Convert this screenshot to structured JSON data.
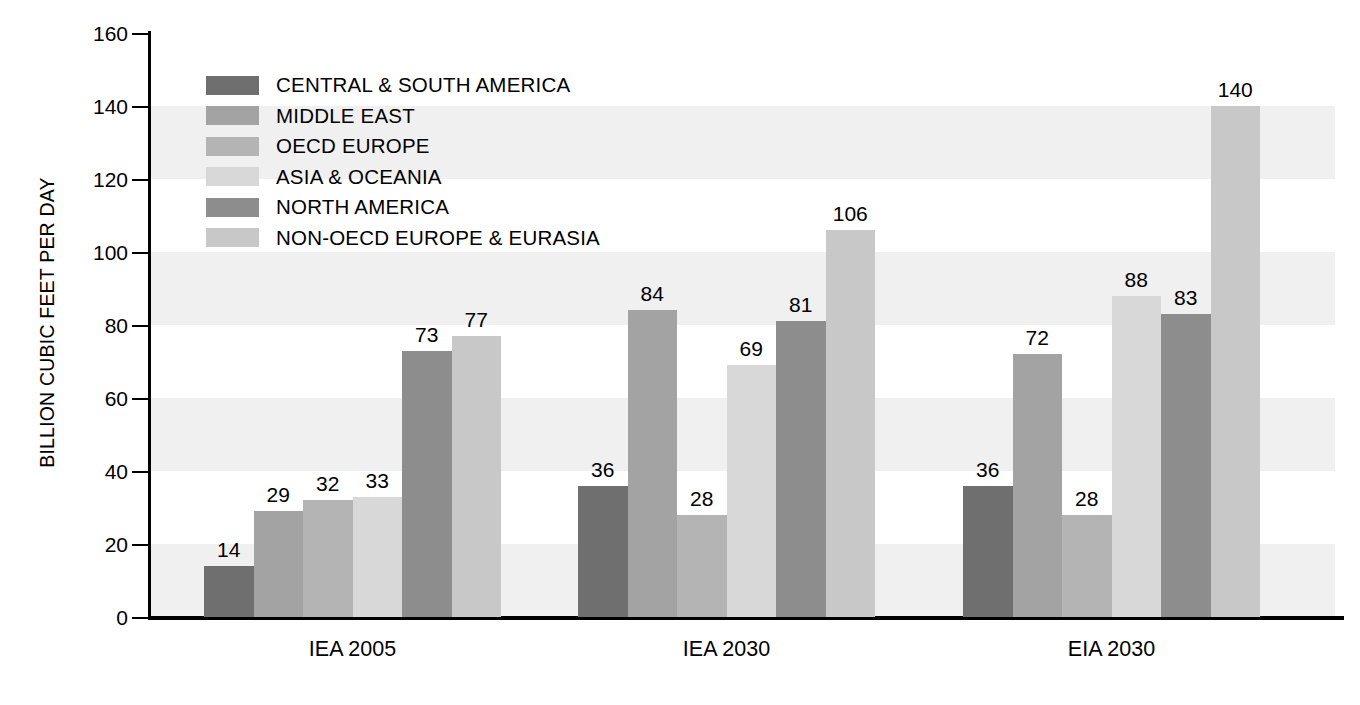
{
  "chart_data": {
    "type": "bar",
    "title": "",
    "subtitle": "",
    "xlabel": "",
    "ylabel": "BILLION CUBIC FEET PER DAY",
    "ylim": [
      0,
      160
    ],
    "yticks": [
      0,
      20,
      40,
      60,
      80,
      100,
      120,
      140,
      160
    ],
    "ytick_labels": [
      "0",
      "20",
      "40",
      "60",
      "80",
      "100",
      "120",
      "140",
      "160"
    ],
    "grid": "horizontal-bands",
    "legend_position": "upper-left-inside",
    "categories": [
      "IEA 2005",
      "IEA 2030",
      "EIA 2030"
    ],
    "series": [
      {
        "name": "CENTRAL & SOUTH AMERICA",
        "color": "#6f6f6f",
        "values": [
          14,
          36,
          36
        ]
      },
      {
        "name": "MIDDLE EAST",
        "color": "#a3a3a3",
        "values": [
          29,
          84,
          72
        ]
      },
      {
        "name": "OECD EUROPE",
        "color": "#b4b4b4",
        "values": [
          32,
          28,
          28
        ]
      },
      {
        "name": "ASIA & OCEANIA",
        "color": "#d8d8d8",
        "values": [
          33,
          69,
          88
        ]
      },
      {
        "name": "NORTH AMERICA",
        "color": "#8d8d8d",
        "values": [
          73,
          81,
          83
        ]
      },
      {
        "name": "NON-OECD EUROPE & EURASIA",
        "color": "#c8c8c8",
        "values": [
          77,
          106,
          140
        ]
      }
    ],
    "band_color": "#f0f0f0",
    "axis_color": "#000000",
    "background_color": "#ffffff"
  }
}
